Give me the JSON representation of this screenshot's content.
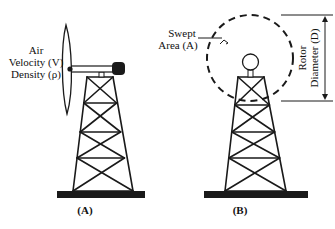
{
  "panel_a": {
    "caption": "(A)",
    "labels": {
      "line1": "Air",
      "line2": "Velocity (V)",
      "line3": "Density (ρ)"
    }
  },
  "panel_b": {
    "caption": "(B)",
    "swept_area": {
      "line1": "Swept",
      "line2": "Area (A)"
    },
    "rotor_diameter": {
      "line1": "Rotor",
      "line2": "Diameter (D)"
    }
  },
  "colors": {
    "stroke": "#1a1a1a",
    "fill_dark": "#1a1a1a",
    "background": "#ffffff"
  }
}
